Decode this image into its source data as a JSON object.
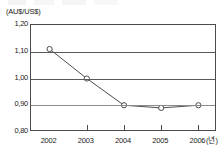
{
  "chart_data": {
    "type": "line",
    "title": "",
    "subtitle": "",
    "xlabel": "(년)",
    "ylabel": "(AU$/US$)",
    "categories": [
      "2002",
      "2003",
      "2004",
      "2005",
      "2006"
    ],
    "x": [
      2002,
      2003,
      2004,
      2005,
      2006
    ],
    "values": [
      1.11,
      1.0,
      0.9,
      0.89,
      0.9
    ],
    "series": [
      {
        "name": "AU$/US$",
        "values": [
          1.11,
          1.0,
          0.9,
          0.89,
          0.9
        ]
      }
    ],
    "ylim": [
      0.8,
      1.2
    ],
    "yticks": [
      1.2,
      1.1,
      1.0,
      0.9,
      0.8
    ],
    "ytick_labels": [
      "1,20",
      "1,10",
      "1,00",
      "0,90",
      "0,80"
    ],
    "xtick_labels": [
      "2002",
      "2003",
      "2004",
      "2005",
      "2006"
    ],
    "grid": true,
    "grid_axis": "y",
    "legend": false,
    "legend_position": "none",
    "marker": "open-circle",
    "decimal_separator": ",",
    "colors": {
      "line": "#4d4d4d",
      "marker_fill": "#ffffff",
      "marker_stroke": "#4d4d4d",
      "gridline": "#5a5a5a",
      "axis": "#4a4a4a",
      "text": "#1a1a1a",
      "background": "#ffffff"
    }
  },
  "axis": {
    "y_unit": "(AU$/US$)",
    "x_unit": "(년)"
  }
}
